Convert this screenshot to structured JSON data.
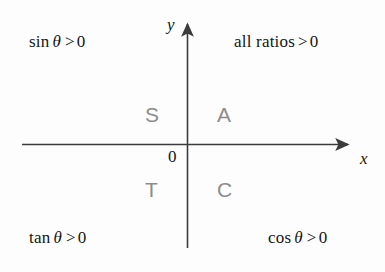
{
  "diagram": {
    "background_color": "#fdfdfd",
    "axis_color": "#3c3c3c",
    "text_color": "#151515",
    "letter_color": "#8c8c8c",
    "origin_label": "0",
    "axes": {
      "x_label": "x",
      "y_label": "y",
      "x_line": {
        "x1": 22,
        "y1": 144,
        "x2": 352,
        "y2": 144
      },
      "y_line": {
        "x1": 187,
        "y1": 248,
        "x2": 187,
        "y2": 19
      }
    },
    "quadrant_conditions": [
      {
        "id": "quadrant-2",
        "function": "sin",
        "variable": "θ",
        "relation": ">",
        "value": "0",
        "full_text": "sin θ > 0"
      },
      {
        "id": "quadrant-1",
        "function": "all ratios",
        "variable": "",
        "relation": ">",
        "value": "0",
        "full_text": "all ratios > 0"
      },
      {
        "id": "quadrant-3",
        "function": "tan",
        "variable": "θ",
        "relation": ">",
        "value": "0",
        "full_text": "tan θ > 0"
      },
      {
        "id": "quadrant-4",
        "function": "cos",
        "variable": "θ",
        "relation": ">",
        "value": "0",
        "full_text": "cos θ > 0"
      }
    ],
    "cast_letters": [
      {
        "id": "letter-s",
        "label": "S",
        "quadrant": 2
      },
      {
        "id": "letter-a",
        "label": "A",
        "quadrant": 1
      },
      {
        "id": "letter-t",
        "label": "T",
        "quadrant": 3
      },
      {
        "id": "letter-c",
        "label": "C",
        "quadrant": 4
      }
    ]
  }
}
